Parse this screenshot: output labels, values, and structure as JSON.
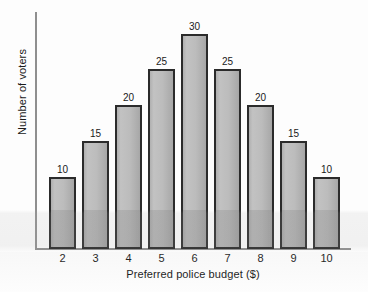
{
  "chart_data": {
    "type": "bar",
    "title": "",
    "xlabel": "Preferred police budget ($)",
    "ylabel": "Number of voters",
    "categories": [
      "2",
      "3",
      "4",
      "5",
      "6",
      "7",
      "8",
      "9",
      "10"
    ],
    "values": [
      10,
      15,
      20,
      25,
      30,
      25,
      20,
      15,
      10
    ],
    "data_labels": [
      "10",
      "15",
      "20",
      "25",
      "30",
      "25",
      "20",
      "15",
      "10"
    ],
    "ylim": [
      0,
      33
    ],
    "xlim": [
      1.5,
      10.5
    ],
    "grid": false,
    "legend": null,
    "y_tick_labels": [],
    "annotations": [],
    "bar_fill_color": "#bcbcbc",
    "bar_edge_color": "#2b2b2b",
    "axis_color": "#8f8f8f",
    "text_color": "#1a1a1a",
    "background_color": "#fdfdfd"
  }
}
